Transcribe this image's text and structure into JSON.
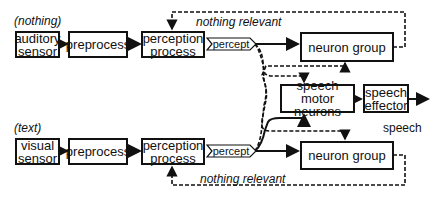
{
  "inputs": {
    "auditory_input": "(nothing)",
    "visual_input": "(text)"
  },
  "auditory_row": {
    "sensor": "auditory sensor",
    "preprocess": "preprocess",
    "perception": "perception process",
    "percept": "percept",
    "neuron_group": "neuron group",
    "feedback": "nothing relevant"
  },
  "visual_row": {
    "sensor": "visual sensor",
    "preprocess": "preprocess",
    "perception": "perception process",
    "percept": "percept",
    "neuron_group": "neuron group",
    "feedback": "nothing relevant"
  },
  "speech": {
    "motor": "speech motor neurons",
    "effector": "speech effector",
    "output": "speech"
  },
  "colors": {
    "line": "#111111",
    "background": "#ffffff"
  }
}
